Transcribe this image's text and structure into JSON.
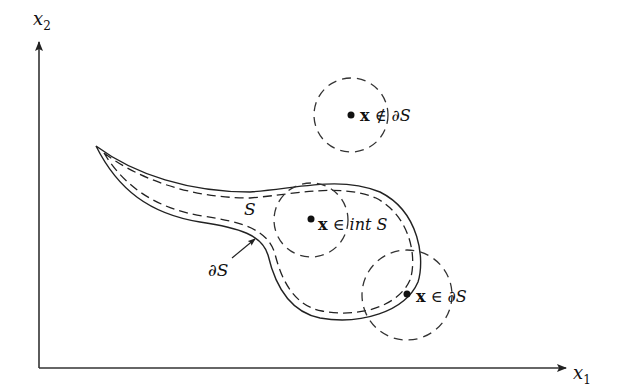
{
  "diagram": {
    "axes": {
      "x_label": "x",
      "x_sub": "1",
      "y_label": "x",
      "y_sub": "2"
    },
    "region": {
      "set_label": "S",
      "boundary_label": "∂S",
      "boundary_pointer": "arrow pointing to boundary curve"
    },
    "points": [
      {
        "name": "exterior-point",
        "bold": "x",
        "relation": " ∉ ",
        "set": "∂S"
      },
      {
        "name": "interior-point",
        "bold": "x",
        "relation": " ∈ ",
        "set": "int S"
      },
      {
        "name": "boundary-point",
        "bold": "x",
        "relation": " ∈ ",
        "set": "∂S"
      }
    ],
    "colors": {
      "line": "#222222",
      "background": "#ffffff"
    }
  }
}
